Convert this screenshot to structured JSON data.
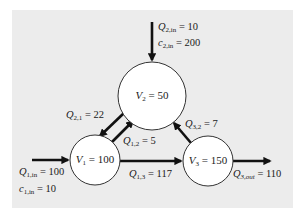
{
  "diagram": {
    "type": "reactor-network",
    "colors": {
      "panel_background": "#ececec",
      "node_fill": "#ffffff",
      "node_stroke": "#333333",
      "arrow": "#111111"
    },
    "nodes": [
      {
        "id": "V1",
        "symbol": "V",
        "subscript": "1",
        "equals": "=",
        "value": "100"
      },
      {
        "id": "V2",
        "symbol": "V",
        "subscript": "2",
        "equals": "=",
        "value": "50"
      },
      {
        "id": "V3",
        "symbol": "V",
        "subscript": "3",
        "equals": "=",
        "value": "150"
      }
    ],
    "flows": [
      {
        "id": "Q2in",
        "symbol": "Q",
        "subscript": "2,in",
        "value": "10",
        "from": "external",
        "to": "V2"
      },
      {
        "id": "c2in",
        "symbol": "c",
        "subscript": "2,in",
        "value": "200",
        "kind": "concentration"
      },
      {
        "id": "Q21",
        "symbol": "Q",
        "subscript": "2,1",
        "value": "22",
        "from": "V2",
        "to": "V1"
      },
      {
        "id": "Q12",
        "symbol": "Q",
        "subscript": "1,2",
        "value": "5",
        "from": "V1",
        "to": "V2"
      },
      {
        "id": "Q32",
        "symbol": "Q",
        "subscript": "3,2",
        "value": "7",
        "from": "V3",
        "to": "V2"
      },
      {
        "id": "Q1in",
        "symbol": "Q",
        "subscript": "1,in",
        "value": "100",
        "from": "external",
        "to": "V1"
      },
      {
        "id": "c1in",
        "symbol": "c",
        "subscript": "1,in",
        "value": "10",
        "kind": "concentration"
      },
      {
        "id": "Q13",
        "symbol": "Q",
        "subscript": "1,3",
        "value": "117",
        "from": "V1",
        "to": "V3"
      },
      {
        "id": "Q3out",
        "symbol": "Q",
        "subscript": "3,out",
        "value": "110",
        "from": "V3",
        "to": "external"
      }
    ]
  }
}
